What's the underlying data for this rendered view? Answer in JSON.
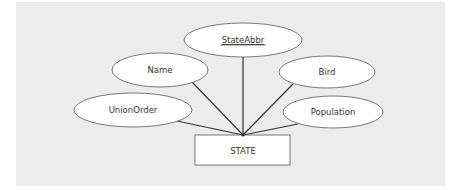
{
  "diagram": {
    "type": "ER diagram",
    "entity": {
      "label": "STATE"
    },
    "attributes": [
      {
        "label": "StateAbbr",
        "key": true
      },
      {
        "label": "Name",
        "key": false
      },
      {
        "label": "Bird",
        "key": false
      },
      {
        "label": "UnionOrder",
        "key": false
      },
      {
        "label": "Population",
        "key": false
      }
    ]
  },
  "colors": {
    "background": "#ececec",
    "shape_fill": "#ffffff",
    "stroke": "#555555",
    "connector": "#333333",
    "text": "#333333"
  }
}
